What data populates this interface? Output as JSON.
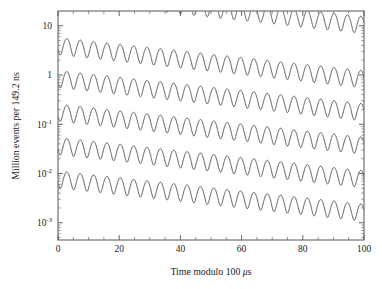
{
  "figure": {
    "name": "muon-g2-wiggle-plot",
    "background": "#ffffff",
    "ink_color": "#4a4a4a",
    "axis_color": "#555555",
    "frame": {
      "left": 58,
      "top": 11,
      "right": 364,
      "bottom": 240
    }
  },
  "axes": {
    "x": {
      "label_prefix": "Time modulo 100 ",
      "label_unit_italic": "μ",
      "label_suffix": "s",
      "label_full": "Time modulo 100 μs",
      "min": 0,
      "max": 100,
      "major_ticks": [
        0,
        20,
        40,
        60,
        80,
        100
      ],
      "tick_labels": [
        "0",
        "20",
        "40",
        "60",
        "80",
        "100"
      ],
      "minor_tick_step": 5
    },
    "y": {
      "label_full": "Million events per 149.2 ns",
      "scale": "log10",
      "min_exp": -3.35,
      "max_exp": 1.3,
      "major_exponents": [
        1,
        0,
        -1,
        -2,
        -3
      ],
      "tick_labels": [
        {
          "mantissa": "10",
          "exponent": ""
        },
        {
          "mantissa": "1",
          "exponent": ""
        },
        {
          "mantissa": "10",
          "exponent": "-1"
        },
        {
          "mantissa": "10",
          "exponent": "-2"
        },
        {
          "mantissa": "10",
          "exponent": "-3"
        }
      ]
    }
  },
  "chart_data": {
    "type": "line",
    "title": "",
    "xlabel": "Time modulo 100 μs",
    "ylabel": "Million events per 149.2 ns",
    "xlim": [
      0,
      100
    ],
    "ylim_log10": [
      -3.35,
      1.3
    ],
    "yscale": "log",
    "grid": false,
    "legend": "none",
    "marker": "dotted-trace",
    "model": {
      "form": "N(t) = N0 * exp(-(t + offset)/tau) * (1 + A*cos(omega*t + phi))",
      "tau_us": 64.4,
      "asymmetry": 0.38,
      "omega_rad_per_us": 1.4388,
      "cycles_per_100us": 22.9,
      "phase_rad": 2.1
    },
    "series": [
      {
        "name": "slice-1-partial",
        "t_start": 30.5,
        "t_end": 100,
        "log10_N0_at_t0": 1.72,
        "peak_value_start": 10.0,
        "peak_value_end": 3.2
      },
      {
        "name": "slice-2",
        "t_start": 0,
        "t_end": 100,
        "log10_N0_at_t0": 0.62,
        "peak_value_start": 4.2,
        "peak_value_end": 1.3
      },
      {
        "name": "slice-3",
        "t_start": 0,
        "t_end": 100,
        "log10_N0_at_t0": -0.05,
        "peak_value_start": 0.9,
        "peak_value_end": 0.28
      },
      {
        "name": "slice-4",
        "t_start": 0,
        "t_end": 100,
        "log10_N0_at_t0": -0.73,
        "peak_value_start": 0.19,
        "peak_value_end": 0.059
      },
      {
        "name": "slice-5",
        "t_start": 0,
        "t_end": 100,
        "log10_N0_at_t0": -1.41,
        "peak_value_start": 0.04,
        "peak_value_end": 0.0125
      },
      {
        "name": "slice-6",
        "t_start": 0,
        "t_end": 100,
        "log10_N0_at_t0": -2.09,
        "peak_value_start": 0.0085,
        "peak_value_end": 0.0026
      }
    ]
  }
}
